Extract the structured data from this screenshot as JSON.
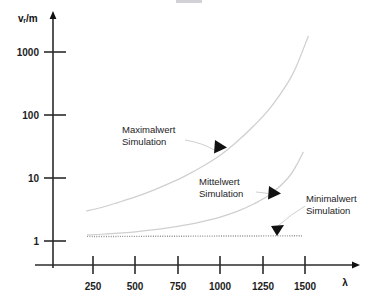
{
  "figure": {
    "background": "#ffffff",
    "curve_color": "#cfcfcf",
    "dotted_color": "#8f8f8f",
    "axis_color": "#2b2b2b",
    "y_axis_title": "vᵣ/m",
    "x_axis_title": "λ"
  },
  "annotations": {
    "max": {
      "line1": "Maximalwert",
      "line2": "Simulation"
    },
    "mean": {
      "line1": "Mittelwert",
      "line2": "Simulation"
    },
    "min": {
      "line1": "Minimalwert",
      "line2": "Simulation"
    }
  },
  "axes": {
    "y_ticks": [
      "1000",
      "100",
      "10",
      "1"
    ],
    "x_ticks": [
      "250",
      "500",
      "750",
      "1000",
      "1250",
      "1500"
    ]
  },
  "chart_data": {
    "type": "line",
    "title": "",
    "subtitle": "",
    "xlabel": "λ",
    "ylabel": "vᵣ/m",
    "xlim": [
      0,
      1600
    ],
    "ylim": [
      1,
      3000
    ],
    "yscale": "log",
    "xscale": "linear",
    "grid": false,
    "legend": "none (inline annotations with leader lines)",
    "y_tick_values": [
      1000,
      100,
      10,
      1
    ],
    "x_tick_values": [
      250,
      500,
      750,
      1000,
      1250,
      1500
    ],
    "series": [
      {
        "name": "Maximalwert Simulation",
        "style": "solid",
        "color": "#cfcfcf",
        "x": [
          210,
          300,
          400,
          500,
          600,
          700,
          800,
          900,
          1000,
          1100,
          1200,
          1300,
          1400,
          1450,
          1520
        ],
        "values": [
          3.0,
          3.4,
          4.1,
          5.0,
          6.3,
          8.2,
          11.0,
          15.5,
          23.0,
          38.0,
          68.0,
          135.0,
          330.0,
          600.0,
          1800.0
        ]
      },
      {
        "name": "Mittelwert Simulation",
        "style": "solid",
        "color": "#cfcfcf",
        "x": [
          215,
          300,
          400,
          500,
          600,
          700,
          800,
          900,
          1000,
          1100,
          1200,
          1300,
          1400,
          1450,
          1490
        ],
        "values": [
          1.25,
          1.28,
          1.33,
          1.4,
          1.5,
          1.63,
          1.8,
          2.05,
          2.4,
          2.95,
          3.9,
          5.6,
          10.0,
          16.0,
          26.0
        ]
      },
      {
        "name": "Minimalwert Simulation",
        "style": "dotted",
        "color": "#8f8f8f",
        "x": [
          215,
          400,
          600,
          800,
          1000,
          1200,
          1400,
          1490
        ],
        "values": [
          1.18,
          1.18,
          1.19,
          1.19,
          1.2,
          1.2,
          1.21,
          1.21
        ]
      }
    ],
    "annotation_markers": [
      {
        "label": "Maximalwert Simulation",
        "arrow_x": 975,
        "arrow_y": 30
      },
      {
        "label": "Mittelwert Simulation",
        "arrow_x": 1265,
        "arrow_y": 5.4
      },
      {
        "label": "Minimalwert Simulation",
        "arrow_x": 1270,
        "arrow_y": 1.45
      }
    ]
  }
}
